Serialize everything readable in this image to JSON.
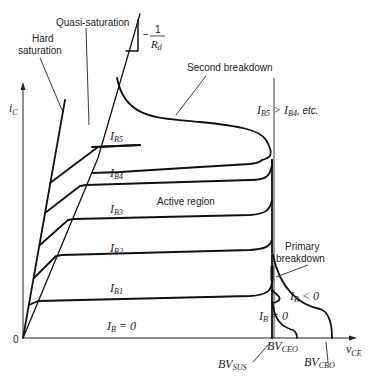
{
  "diagram": {
    "axes": {
      "y_label": "i",
      "y_label_sub": "C",
      "x_label": "v",
      "x_label_sub": "CE",
      "origin": "0"
    },
    "labels": {
      "hard_saturation_1": "Hard",
      "hard_saturation_2": "saturation",
      "quasi_saturation": "Quasi-saturation",
      "slope_minus": "−",
      "slope_num": "1",
      "slope_den": "R",
      "slope_den_sub": "d",
      "second_breakdown": "Second breakdown",
      "active_region": "Active region",
      "primary_breakdown_1": "Primary",
      "primary_breakdown_2": "breakdown",
      "ib_order_a": "I",
      "ib_order_a_sub": "B5",
      "ib_order_mid": " > ",
      "ib_order_b": "I",
      "ib_order_b_sub": "B4",
      "ib_order_tail": ", etc.",
      "ib_neg": "I",
      "ib_neg_sub": "B",
      "ib_neg_tail": " < 0",
      "ib_zero_right": "I",
      "ib_zero_right_sub": "B",
      "ib_zero_right_tail": " = 0",
      "bv_sus": "BV",
      "bv_sus_sub": "SUS",
      "bv_ceo": "BV",
      "bv_ceo_sub": "CEO",
      "bv_cbo": "BV",
      "bv_cbo_sub": "CBO"
    },
    "curves": [
      {
        "name": "I",
        "sub": "B5"
      },
      {
        "name": "I",
        "sub": "B4"
      },
      {
        "name": "I",
        "sub": "B3"
      },
      {
        "name": "I",
        "sub": "B2"
      },
      {
        "name": "I",
        "sub": "B1"
      },
      {
        "name": "I",
        "sub": "B",
        "tail": " = 0"
      }
    ]
  }
}
